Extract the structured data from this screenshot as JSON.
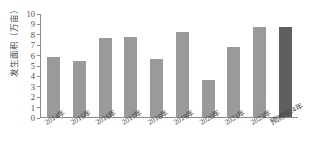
{
  "chart_data": {
    "type": "bar",
    "title": "",
    "xlabel": "",
    "ylabel": "发生面积（万亩）",
    "ylim": [
      0,
      10
    ],
    "ytick_step": 1,
    "grid": false,
    "legend": "none",
    "categories": [
      "2014年",
      "2015年",
      "2016年",
      "2017年",
      "2018年",
      "2019年",
      "2020年",
      "2021年",
      "2023年",
      "预测2024年"
    ],
    "values": [
      5.8,
      5.4,
      7.6,
      7.7,
      5.6,
      8.2,
      3.6,
      6.7,
      8.7,
      8.7
    ],
    "series": [
      {
        "name": "发生面积（万亩）",
        "values": [
          5.8,
          5.4,
          7.6,
          7.7,
          5.6,
          8.2,
          3.6,
          6.7,
          8.7,
          8.7
        ]
      }
    ],
    "bar_styles": [
      "actual",
      "actual",
      "actual",
      "actual",
      "actual",
      "actual",
      "actual",
      "actual",
      "actual",
      "forecast"
    ],
    "colors": {
      "bar": "#9a9a9a",
      "forecast_bar": "#5f5f5f",
      "axis": "#8c8c8c",
      "text": "#3f3f3f",
      "background": "#ffffff"
    },
    "yticks": [
      "0",
      "1",
      "2",
      "3",
      "4",
      "5",
      "6",
      "7",
      "8",
      "9",
      "10"
    ]
  }
}
